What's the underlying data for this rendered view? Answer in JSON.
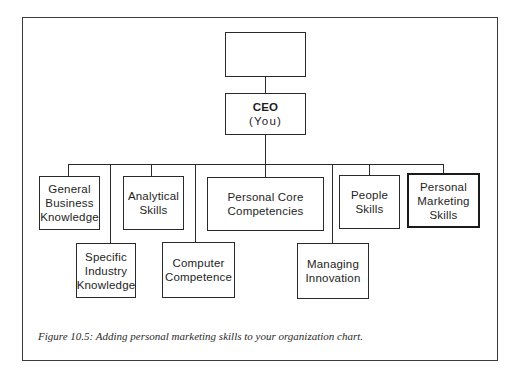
{
  "diagram": {
    "type": "org-chart",
    "top_box": {
      "label": ""
    },
    "ceo": {
      "title": "CEO",
      "subtitle": "(You)"
    },
    "nodes": [
      {
        "id": "general-business-knowledge",
        "label": "General\nBusiness\nKnowledge",
        "row": 1
      },
      {
        "id": "specific-industry-knowledge",
        "label": "Specific\nIndustry\nKnowledge",
        "row": 2
      },
      {
        "id": "analytical-skills",
        "label": "Analytical\nSkills",
        "row": 1
      },
      {
        "id": "computer-competence",
        "label": "Computer\nCompetence",
        "row": 2
      },
      {
        "id": "personal-core-competencies",
        "label": "Personal Core\nCompetencies",
        "row": 1
      },
      {
        "id": "managing-innovation",
        "label": "Managing\nInnovation",
        "row": 2
      },
      {
        "id": "people-skills",
        "label": "People\nSkills",
        "row": 1
      },
      {
        "id": "personal-marketing-skills",
        "label": "Personal\nMarketing\nSkills",
        "row": 1,
        "highlighted": true
      }
    ],
    "edges": [
      [
        "top_box",
        "ceo"
      ],
      [
        "ceo",
        "general-business-knowledge"
      ],
      [
        "ceo",
        "specific-industry-knowledge"
      ],
      [
        "ceo",
        "analytical-skills"
      ],
      [
        "ceo",
        "computer-competence"
      ],
      [
        "ceo",
        "personal-core-competencies"
      ],
      [
        "ceo",
        "managing-innovation"
      ],
      [
        "ceo",
        "people-skills"
      ],
      [
        "ceo",
        "personal-marketing-skills"
      ]
    ]
  },
  "caption": "Figure 10.5: Adding personal marketing skills to your organization chart."
}
